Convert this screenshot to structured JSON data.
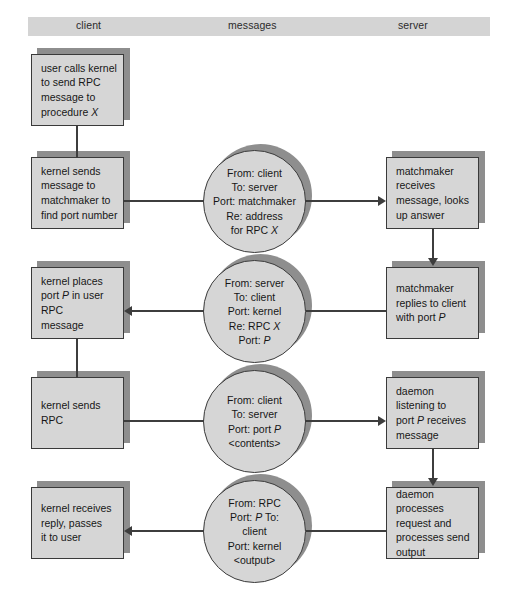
{
  "diagram": {
    "columns": [
      {
        "id": "client",
        "label": "client"
      },
      {
        "id": "messages",
        "label": "messages"
      },
      {
        "id": "server",
        "label": "server"
      }
    ],
    "colors": {
      "header_band": "#d4d4d4",
      "node_fill": "#d6d6d6",
      "node_border": "#3a3a3a",
      "node_shadow": "#8e8e8e",
      "connector": "#3d3d3d",
      "page_background": "#ffffff"
    },
    "client_steps": [
      {
        "id": "client-step-1",
        "lines": [
          "user calls kernel",
          "to send RPC",
          "message to",
          "procedure X"
        ],
        "italic_tokens": [
          "X"
        ]
      },
      {
        "id": "client-step-2",
        "lines": [
          "kernel sends",
          "message to",
          "matchmaker to",
          "find port number"
        ],
        "italic_tokens": []
      },
      {
        "id": "client-step-3",
        "lines": [
          "kernel places",
          "port P in user",
          "RPC",
          "message"
        ],
        "italic_tokens": [
          "P"
        ]
      },
      {
        "id": "client-step-4",
        "lines": [
          "kernel sends",
          "RPC"
        ],
        "italic_tokens": []
      },
      {
        "id": "client-step-5",
        "lines": [
          "kernel receives",
          "reply, passes",
          "it to user"
        ],
        "italic_tokens": []
      }
    ],
    "messages": [
      {
        "id": "message-1",
        "lines": [
          "From: client",
          "To: server",
          "Port: matchmaker",
          "Re: address",
          "for RPC X"
        ],
        "italic_tokens": [
          "X"
        ]
      },
      {
        "id": "message-2",
        "lines": [
          "From: server",
          "To: client",
          "Port: kernel",
          "Re: RPC X",
          "Port: P"
        ],
        "italic_tokens": [
          "X",
          "P"
        ]
      },
      {
        "id": "message-3",
        "lines": [
          "From: client",
          "To: server",
          "Port: port P",
          "<contents>"
        ],
        "italic_tokens": [
          "P"
        ]
      },
      {
        "id": "message-4",
        "lines": [
          "From: RPC",
          "Port: P To:",
          "client",
          "Port: kernel",
          "<output>"
        ],
        "italic_tokens": [
          "P"
        ]
      }
    ],
    "server_steps": [
      {
        "id": "server-step-1",
        "lines": [
          "matchmaker",
          "receives",
          "message, looks",
          "up answer"
        ],
        "italic_tokens": []
      },
      {
        "id": "server-step-2",
        "lines": [
          "matchmaker",
          "replies to client",
          "with port P"
        ],
        "italic_tokens": [
          "P"
        ]
      },
      {
        "id": "server-step-3",
        "lines": [
          "daemon",
          "listening to",
          "port P receives",
          "message"
        ],
        "italic_tokens": [
          "P"
        ]
      },
      {
        "id": "server-step-4",
        "lines": [
          "daemon",
          "processes",
          "request and",
          "processes send",
          "output"
        ],
        "italic_tokens": []
      }
    ]
  }
}
